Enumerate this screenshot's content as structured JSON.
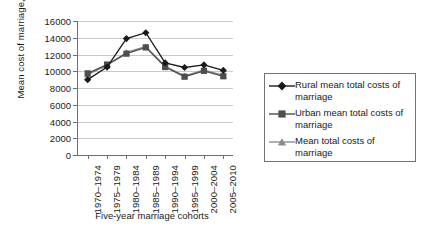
{
  "chart_data": {
    "type": "line",
    "title": "",
    "xlabel": "Five-year marriage cohorts",
    "ylabel": "Mean cost of marriage, 2010 JD",
    "categories": [
      "1970–1974",
      "1975–1979",
      "1980–1984",
      "1985–1989",
      "1990–1994",
      "1995–1999",
      "2000–2004",
      "2005–2010"
    ],
    "ylim": [
      0,
      16000
    ],
    "ytick_step": 2000,
    "yticks": [
      "16000",
      "14000",
      "12000",
      "10000",
      "8000",
      "6000",
      "4000",
      "2000",
      "0"
    ],
    "grid": true,
    "legend_position": "right",
    "series": [
      {
        "name": "Rural mean total costs of marriage",
        "marker": "diamond",
        "color": "#1a1a1a",
        "values": [
          9000,
          10500,
          13900,
          14600,
          11000,
          10450,
          10750,
          10100
        ]
      },
      {
        "name": "Urban mean total costs of marriage",
        "marker": "square",
        "color": "#4d4d4d",
        "values": [
          9750,
          10800,
          12100,
          12850,
          10500,
          9350,
          10050,
          9400
        ]
      },
      {
        "name": "Mean total costs of marriage",
        "marker": "triangle",
        "color": "#8c8c8c",
        "values": [
          9600,
          10700,
          12250,
          12950,
          10600,
          9450,
          10150,
          9500
        ]
      }
    ]
  },
  "legend": {
    "items": [
      "Rural mean total costs of marriage",
      "Urban mean total costs of marriage",
      "Mean total costs of marriage"
    ]
  }
}
